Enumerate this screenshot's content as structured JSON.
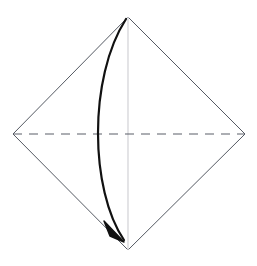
{
  "diagram": {
    "type": "origami-instruction",
    "canvas": {
      "width": 257,
      "height": 266,
      "background": "#ffffff"
    },
    "colors": {
      "paper_edge": "#555a63",
      "crease_dashed": "#5a5f68",
      "crease_center_light": "#d8d8dc",
      "fold_arrow": "#111111",
      "background": "#ffffff"
    },
    "shapes": {
      "paper_outline": {
        "name": "square-rotated-45-diamond",
        "points": [
          {
            "label": "top",
            "x": 128,
            "y": 17
          },
          {
            "label": "right",
            "x": 245,
            "y": 134
          },
          {
            "label": "bottom",
            "x": 128,
            "y": 250
          },
          {
            "label": "left",
            "x": 13,
            "y": 134
          }
        ],
        "stroke_width": 1,
        "fill": "none"
      },
      "horizontal_crease": {
        "name": "dashed-horizontal-crease",
        "from": {
          "x": 13,
          "y": 134
        },
        "to": {
          "x": 245,
          "y": 134
        },
        "style": "dashed",
        "dash_length": 9,
        "dash_gap": 7,
        "stroke_width": 1.1
      },
      "vertical_crease": {
        "name": "light-vertical-centerline",
        "from": {
          "x": 128,
          "y": 17
        },
        "to": {
          "x": 128,
          "y": 250
        },
        "style": "solid-light",
        "stroke_width": 1.4
      },
      "fold_arrow": {
        "name": "curved-fold-arrow",
        "start": {
          "x": 126,
          "y": 19
        },
        "end": {
          "x": 124,
          "y": 240
        },
        "control_1": {
          "x": 88,
          "y": 78
        },
        "control_2": {
          "x": 90,
          "y": 190
        },
        "stroke_width": 2.2,
        "direction": "top-vertex-to-bottom-vertex, bowing left",
        "arrowhead": {
          "name": "solid-triangle-arrowhead",
          "points": [
            {
              "x": 124,
              "y": 242
            },
            {
              "x": 104,
              "y": 221
            },
            {
              "x": 110,
              "y": 236
            }
          ],
          "fill": "#111111"
        }
      }
    }
  },
  "a11y": {
    "figure_caption": "Square sheet shown as a diamond with a horizontal dashed crease and a light vertical centerline; a curved arrow sweeps from the top corner down the left side to the bottom corner indicating the fold."
  }
}
